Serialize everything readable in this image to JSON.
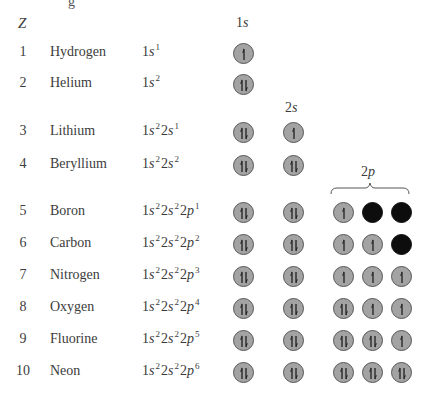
{
  "header": {
    "z_label": "Z",
    "top_fragment": "g",
    "subshell_labels": {
      "s1": {
        "num": "1",
        "letter": "s"
      },
      "s2": {
        "num": "2",
        "letter": "s"
      },
      "p2": {
        "num": "2",
        "letter": "p"
      }
    }
  },
  "colors": {
    "occupied_fill": "#a3a3a3",
    "empty_fill": "#0d0d0d",
    "outline": "#555555",
    "text": "#3c3c3c"
  },
  "elements": [
    {
      "z": "1",
      "name": "Hydrogen",
      "config": [
        [
          "1",
          "s",
          "1"
        ]
      ],
      "orbitals": {
        "1s": "up"
      }
    },
    {
      "z": "2",
      "name": "Helium",
      "config": [
        [
          "1",
          "s",
          "2"
        ]
      ],
      "orbitals": {
        "1s": "pair"
      }
    },
    {
      "z": "3",
      "name": "Lithium",
      "config": [
        [
          "1",
          "s",
          "2"
        ],
        [
          "2",
          "s",
          "1"
        ]
      ],
      "orbitals": {
        "1s": "pair",
        "2s": "up"
      }
    },
    {
      "z": "4",
      "name": "Beryllium",
      "config": [
        [
          "1",
          "s",
          "2"
        ],
        [
          "2",
          "s",
          "2"
        ]
      ],
      "orbitals": {
        "1s": "pair",
        "2s": "pair"
      }
    },
    {
      "z": "5",
      "name": "Boron",
      "config": [
        [
          "1",
          "s",
          "2"
        ],
        [
          "2",
          "s",
          "2"
        ],
        [
          "2",
          "p",
          "1"
        ]
      ],
      "orbitals": {
        "1s": "pair",
        "2s": "pair",
        "2p": [
          "up",
          "empty",
          "empty"
        ]
      }
    },
    {
      "z": "6",
      "name": "Carbon",
      "config": [
        [
          "1",
          "s",
          "2"
        ],
        [
          "2",
          "s",
          "2"
        ],
        [
          "2",
          "p",
          "2"
        ]
      ],
      "orbitals": {
        "1s": "pair",
        "2s": "pair",
        "2p": [
          "up",
          "up",
          "empty"
        ]
      }
    },
    {
      "z": "7",
      "name": "Nitrogen",
      "config": [
        [
          "1",
          "s",
          "2"
        ],
        [
          "2",
          "s",
          "2"
        ],
        [
          "2",
          "p",
          "3"
        ]
      ],
      "orbitals": {
        "1s": "pair",
        "2s": "pair",
        "2p": [
          "up",
          "up",
          "up"
        ]
      }
    },
    {
      "z": "8",
      "name": "Oxygen",
      "config": [
        [
          "1",
          "s",
          "2"
        ],
        [
          "2",
          "s",
          "2"
        ],
        [
          "2",
          "p",
          "4"
        ]
      ],
      "orbitals": {
        "1s": "pair",
        "2s": "pair",
        "2p": [
          "pair",
          "up",
          "up"
        ]
      }
    },
    {
      "z": "9",
      "name": "Fluorine",
      "config": [
        [
          "1",
          "s",
          "2"
        ],
        [
          "2",
          "s",
          "2"
        ],
        [
          "2",
          "p",
          "5"
        ]
      ],
      "orbitals": {
        "1s": "pair",
        "2s": "pair",
        "2p": [
          "pair",
          "pair",
          "up"
        ]
      }
    },
    {
      "z": "10",
      "name": "Neon",
      "config": [
        [
          "1",
          "s",
          "2"
        ],
        [
          "2",
          "s",
          "2"
        ],
        [
          "2",
          "p",
          "6"
        ]
      ],
      "orbitals": {
        "1s": "pair",
        "2s": "pair",
        "2p": [
          "pair",
          "pair",
          "pair"
        ]
      }
    }
  ]
}
